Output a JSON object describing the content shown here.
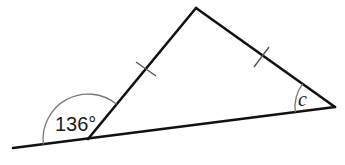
{
  "diagram": {
    "type": "geometry-isosceles-triangle",
    "vertices": {
      "top": [
        196,
        8
      ],
      "right": [
        335,
        107
      ],
      "bottom_left": [
        88,
        139
      ]
    },
    "extended_line_left_end": [
      13,
      148
    ],
    "equal_sides": [
      "bottom_left-top",
      "top-right"
    ],
    "tick_marks": [
      {
        "side": "bottom_left-top",
        "position": [
          146,
          69
        ]
      },
      {
        "side": "top-right",
        "position": [
          262,
          57
        ]
      }
    ],
    "angles": [
      {
        "name": "exterior",
        "vertex": "bottom_left",
        "label": "136°",
        "value_degrees": 136
      },
      {
        "name": "c",
        "vertex": "right",
        "label": "c"
      }
    ],
    "colors": {
      "line": "#111111",
      "arc": "#777777",
      "tick": "#555555",
      "text": "#1a1a1a"
    }
  }
}
